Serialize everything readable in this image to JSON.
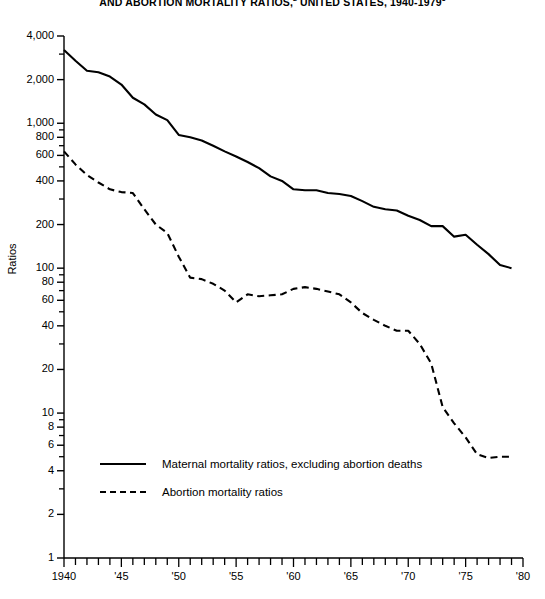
{
  "title": {
    "line1": "AND ABORTION MORTALITY RATIOS,",
    "sup1": "2",
    "line1b": " UNITED STATES, 1940-1979",
    "sup2": "3",
    "full": "AND ABORTION MORTALITY RATIOS,2 UNITED STATES, 1940-19793"
  },
  "legend": {
    "items": [
      {
        "label": "Maternal mortality ratios, excluding abortion deaths",
        "style": "solid"
      },
      {
        "label": "Abortion mortality ratios",
        "style": "dashed"
      }
    ]
  },
  "chart_data": {
    "type": "line",
    "title": "AND ABORTION MORTALITY RATIOS,2 UNITED STATES, 1940-19793",
    "xlabel": "",
    "ylabel": "Ratios",
    "yscale": "log",
    "ylim": [
      1,
      4000
    ],
    "xlim": [
      1940,
      1980
    ],
    "grid": false,
    "legend_position": "inside-lower-left",
    "ytick_values": [
      1,
      2,
      4,
      6,
      8,
      10,
      20,
      40,
      60,
      80,
      100,
      200,
      400,
      600,
      800,
      1000,
      2000,
      4000
    ],
    "ytick_labels": [
      "1",
      "2",
      "4",
      "6",
      "8",
      "10",
      "20",
      "40",
      "60",
      "80",
      "100",
      "200",
      "400",
      "600",
      "800",
      "1,000",
      "2,000",
      "4,000"
    ],
    "yminor_values": [
      3,
      5,
      7,
      9,
      30,
      50,
      70,
      90,
      300,
      500,
      700,
      900,
      3000
    ],
    "xtick_values": [
      1940,
      1941,
      1942,
      1943,
      1944,
      1945,
      1946,
      1947,
      1948,
      1949,
      1950,
      1951,
      1952,
      1953,
      1954,
      1955,
      1956,
      1957,
      1958,
      1959,
      1960,
      1961,
      1962,
      1963,
      1964,
      1965,
      1966,
      1967,
      1968,
      1969,
      1970,
      1971,
      1972,
      1973,
      1974,
      1975,
      1976,
      1977,
      1978,
      1979,
      1980
    ],
    "xtick_labeled": [
      {
        "value": 1940,
        "label": "1940"
      },
      {
        "value": 1945,
        "label": "'45"
      },
      {
        "value": 1950,
        "label": "'50"
      },
      {
        "value": 1955,
        "label": "'55"
      },
      {
        "value": 1960,
        "label": "'60"
      },
      {
        "value": 1965,
        "label": "'65"
      },
      {
        "value": 1970,
        "label": "'70"
      },
      {
        "value": 1975,
        "label": "'75"
      },
      {
        "value": 1980,
        "label": "'80"
      }
    ],
    "x": [
      1940,
      1941,
      1942,
      1943,
      1944,
      1945,
      1946,
      1947,
      1948,
      1949,
      1950,
      1951,
      1952,
      1953,
      1954,
      1955,
      1956,
      1957,
      1958,
      1959,
      1960,
      1961,
      1962,
      1963,
      1964,
      1965,
      1966,
      1967,
      1968,
      1969,
      1970,
      1971,
      1972,
      1973,
      1974,
      1975,
      1976,
      1977,
      1978,
      1979
    ],
    "series": [
      {
        "name": "Maternal mortality ratios, excluding abortion deaths",
        "style": "solid",
        "values": [
          3200,
          2700,
          2300,
          2250,
          2100,
          1850,
          1500,
          1350,
          1150,
          1050,
          830,
          800,
          760,
          700,
          640,
          590,
          540,
          490,
          430,
          400,
          350,
          345,
          345,
          330,
          325,
          315,
          290,
          265,
          255,
          250,
          230,
          215,
          195,
          195,
          165,
          170,
          145,
          125,
          105,
          100
        ]
      },
      {
        "name": "Abortion mortality ratios",
        "style": "dashed",
        "values": [
          640,
          520,
          440,
          390,
          350,
          335,
          330,
          255,
          200,
          175,
          120,
          86,
          84,
          78,
          70,
          58,
          66,
          64,
          65,
          66,
          72,
          74,
          72,
          69,
          66,
          58,
          49,
          44,
          40,
          37,
          37,
          30,
          22,
          11,
          8.5,
          6.8,
          5.2,
          4.9,
          5.0,
          5.0
        ]
      }
    ]
  }
}
